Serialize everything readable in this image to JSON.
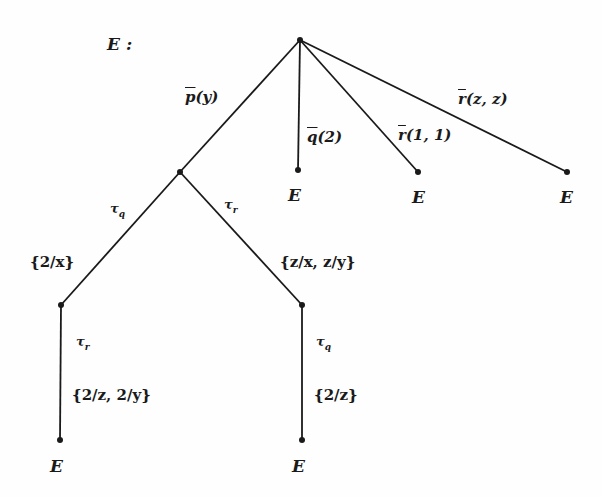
{
  "diagram": {
    "title": "E :",
    "nodes": [
      {
        "id": "root",
        "x": 300,
        "y": 40
      },
      {
        "id": "n_p",
        "x": 180,
        "y": 172
      },
      {
        "id": "leaf_q",
        "x": 298,
        "y": 170,
        "label": "E"
      },
      {
        "id": "leaf_r11",
        "x": 418,
        "y": 172,
        "label": "E"
      },
      {
        "id": "leaf_rzz",
        "x": 567,
        "y": 172,
        "label": "E"
      },
      {
        "id": "n_tq",
        "x": 61,
        "y": 305
      },
      {
        "id": "n_tr",
        "x": 302,
        "y": 305
      },
      {
        "id": "leaf_bl",
        "x": 60,
        "y": 440,
        "label": "E"
      },
      {
        "id": "leaf_br",
        "x": 302,
        "y": 440,
        "label": "E"
      }
    ],
    "edges": [
      {
        "from": "root",
        "to": "n_p",
        "label": "p(y)",
        "overline": true
      },
      {
        "from": "root",
        "to": "leaf_q",
        "label": "q(2)",
        "overline": true
      },
      {
        "from": "root",
        "to": "leaf_r11",
        "label": "r(1, 1)",
        "overline": true
      },
      {
        "from": "root",
        "to": "leaf_rzz",
        "label": "r(z, z)",
        "overline": true
      },
      {
        "from": "n_p",
        "to": "n_tq",
        "label": "τq",
        "subst": "{2/x}"
      },
      {
        "from": "n_p",
        "to": "n_tr",
        "label": "τr",
        "subst": "{z/x, z/y}"
      },
      {
        "from": "n_tq",
        "to": "leaf_bl",
        "label": "τr",
        "subst": "{2/z, 2/y}"
      },
      {
        "from": "n_tr",
        "to": "leaf_br",
        "label": "τq",
        "subst": "{2/z}"
      }
    ],
    "labels": {
      "title": "E :",
      "p_y": "p",
      "p_y_arg": "(y)",
      "q_2": "q",
      "q_2_arg": "(2)",
      "r_11": "r",
      "r_11_arg": "(1, 1)",
      "r_zz": "r",
      "r_zz_arg": "(z, z)",
      "tau": "τ",
      "sub_q": "q",
      "sub_r": "r",
      "s_2x": "{2/x}",
      "s_zxzy": "{z/x, z/y}",
      "s_2z2y": "{2/z, 2/y}",
      "s_2z": "{2/z}",
      "leaf": "E"
    }
  }
}
